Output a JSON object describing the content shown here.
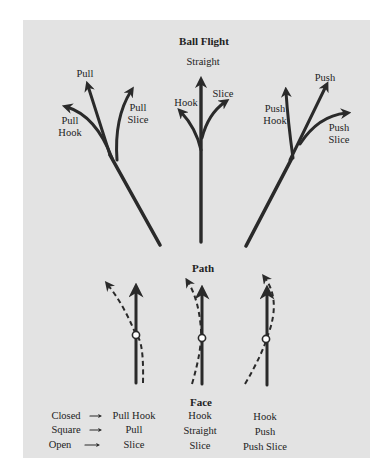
{
  "title": "Ball Flight",
  "flight_groups": [
    {
      "name": "pull",
      "labels": {
        "top": "Pull",
        "left_1": "Pull",
        "left_2": "Hook",
        "right_1": "Pull",
        "right_2": "Slice"
      }
    },
    {
      "name": "straight",
      "labels": {
        "top": "Straight",
        "left": "Hook",
        "right": "Slice"
      }
    },
    {
      "name": "push",
      "labels": {
        "top": "Push",
        "left_1": "Push",
        "left_2": "Hook",
        "right_1": "Push",
        "right_2": "Slice"
      }
    }
  ],
  "path_label": "Path",
  "face_label": "Face",
  "legend": {
    "rows": [
      {
        "face": "Closed",
        "cells": [
          "Pull Hook",
          "Hook",
          "Hook"
        ]
      },
      {
        "face": "Square",
        "cells": [
          "Pull",
          "Straight",
          "Push"
        ]
      },
      {
        "face": "Open",
        "cells": [
          "Slice",
          "Slice",
          "Push Slice"
        ]
      }
    ]
  },
  "colors": {
    "panel": "#e3e3e3",
    "ink": "#2a2a2a"
  }
}
